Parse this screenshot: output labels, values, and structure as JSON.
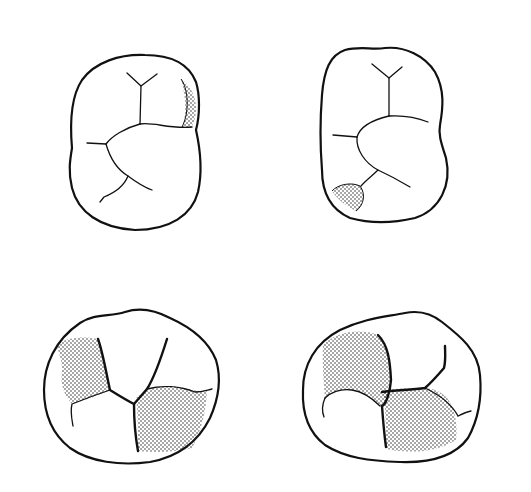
{
  "figure": {
    "type": "dental occlusal outline illustration",
    "background": "#ffffff",
    "ink_color": "#111111",
    "teeth": [
      {
        "id": "top-left",
        "view": "occlusal outline",
        "shaded_region": "distal marginal ridge area (upper right)"
      },
      {
        "id": "top-right",
        "view": "occlusal outline",
        "shaded_region": "lower left cusp area"
      },
      {
        "id": "bottom-left",
        "view": "occlusal outline",
        "shaded_region": "two cusps (left and lower right)"
      },
      {
        "id": "bottom-right",
        "view": "occlusal outline",
        "shaded_region": "two cusps (upper left and lower center)"
      }
    ]
  }
}
